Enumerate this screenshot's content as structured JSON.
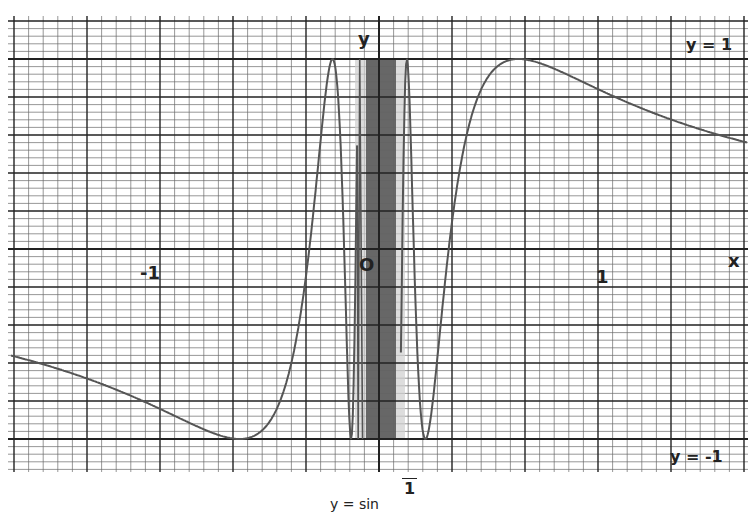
{
  "chart_data": {
    "type": "line",
    "title": "",
    "caption": "y = sin 1/x",
    "function": "y = sin(1/x)",
    "xlabel": "x",
    "ylabel": "y",
    "origin_label": "O",
    "xlim": [
      -1.67,
      1.67
    ],
    "ylim": [
      -1.2,
      1.2
    ],
    "x_ticks": [
      {
        "value": -1,
        "label": "-1"
      },
      {
        "value": 1,
        "label": "1"
      }
    ],
    "asymptote_labels": [
      {
        "value": 1,
        "label": "y = 1"
      },
      {
        "value": -1,
        "label": "y = -1"
      }
    ],
    "grid": true,
    "legend": null,
    "series": [
      {
        "name": "sin(1/x)",
        "x": [
          -1.66,
          -1.4,
          -1.2,
          -1.0,
          -0.8,
          -0.64,
          -0.55,
          -0.45,
          -0.35,
          -0.3,
          -0.25,
          0.25,
          0.3,
          0.35,
          0.45,
          0.55,
          0.64,
          0.8,
          1.0,
          1.2,
          1.4,
          1.66
        ],
        "values": [
          -0.56,
          -0.65,
          -0.74,
          -0.84,
          -0.95,
          -1.0,
          -0.98,
          -0.8,
          -0.28,
          0.19,
          0.76,
          -0.76,
          -0.19,
          0.28,
          0.8,
          0.98,
          1.0,
          0.95,
          0.84,
          0.74,
          0.65,
          0.56
        ]
      }
    ],
    "colors": {
      "curve": "#555555",
      "band_dark": "#5a5a5a",
      "band_light": "#cfcfcf",
      "grid_major": "#222222",
      "grid_minor": "#666666"
    }
  },
  "labels": {
    "y_axis": "y",
    "x_axis": "x",
    "origin": "O",
    "x_neg_one": "-1",
    "x_pos_one": "1",
    "y_eq_1": "y = 1",
    "y_eq_neg1": "y = -1",
    "caption_num": "1",
    "caption_text": "y = sin"
  }
}
